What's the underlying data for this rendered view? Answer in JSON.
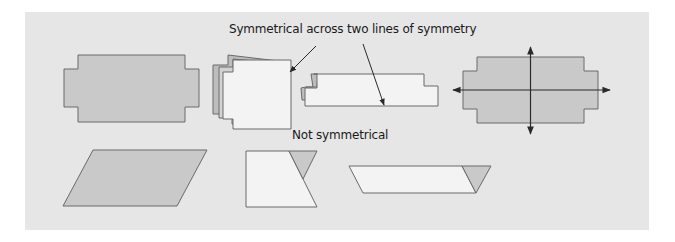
{
  "diagram": {
    "labels": {
      "symmetrical": "Symmetrical across two lines of symmetry",
      "not_symmetrical": "Not symmetrical"
    },
    "colors": {
      "background_panel": "#e6e6e6",
      "shape_fill_dark": "#c9c9c9",
      "shape_fill_light": "#f3f3f3",
      "stroke": "#6a6a6a",
      "arrow": "#2a2a2a"
    },
    "shapes": [
      {
        "id": "stepped-rectangle",
        "group": "symmetrical",
        "state": "flat"
      },
      {
        "id": "stepped-rectangle-folded-vertical",
        "group": "symmetrical",
        "state": "folded along vertical line"
      },
      {
        "id": "stepped-rectangle-folded-horizontal",
        "group": "symmetrical",
        "state": "folded along horizontal line"
      },
      {
        "id": "stepped-rectangle-with-axes",
        "group": "symmetrical",
        "state": "shown with two lines of symmetry"
      },
      {
        "id": "parallelogram",
        "group": "not_symmetrical",
        "state": "flat"
      },
      {
        "id": "parallelogram-folded-vertical",
        "group": "not_symmetrical",
        "state": "folded, does not match"
      },
      {
        "id": "parallelogram-folded-horizontal",
        "group": "not_symmetrical",
        "state": "folded, does not match"
      }
    ]
  }
}
